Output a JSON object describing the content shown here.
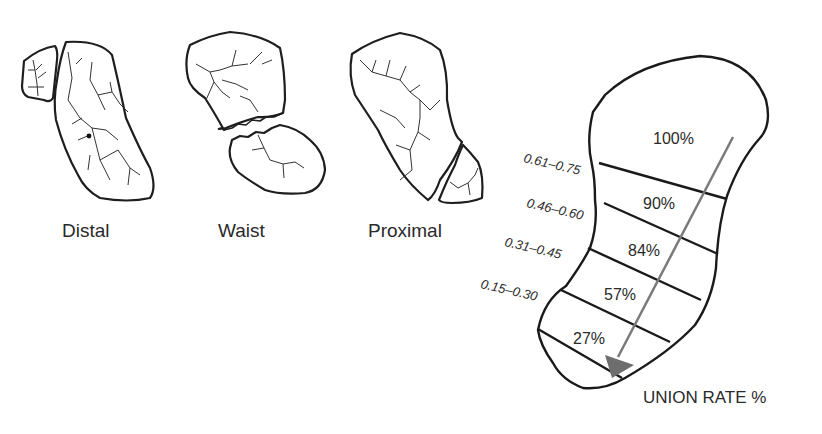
{
  "fracture_types": [
    {
      "label": "Distal"
    },
    {
      "label": "Waist"
    },
    {
      "label": "Proximal"
    }
  ],
  "union_diagram": {
    "zones": [
      {
        "union_rate": "100%",
        "ratio_range": ""
      },
      {
        "union_rate": "90%",
        "ratio_range": "0.61–0.75"
      },
      {
        "union_rate": "84%",
        "ratio_range": "0.46–0.60"
      },
      {
        "union_rate": "57%",
        "ratio_range": "0.31–0.45"
      },
      {
        "union_rate": "27%",
        "ratio_range": "0.15–0.30"
      }
    ],
    "axis_label": "UNION RATE %",
    "arrow_color": "#7a7a7a",
    "outline_color": "#1a1a1a"
  }
}
